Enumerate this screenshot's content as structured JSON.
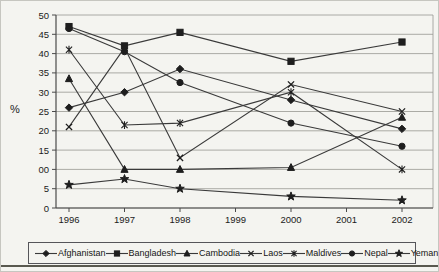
{
  "chart_data": {
    "type": "line",
    "title": "",
    "ylabel": "%",
    "x_categories": [
      "1996",
      "1997",
      "1998",
      "1999",
      "2000",
      "2001",
      "2002"
    ],
    "data_x": [
      "1996",
      "1997",
      "1998",
      "2000",
      "2002"
    ],
    "y_tick_labels": [
      "50",
      "45",
      "40",
      "35",
      "30",
      "25",
      "20",
      "15",
      "00",
      "5",
      "0"
    ],
    "y_tick_values": [
      50,
      45,
      40,
      35,
      30,
      25,
      20,
      15,
      10,
      5,
      0
    ],
    "ylim": [
      0,
      50
    ],
    "grid": true,
    "legend_position": "bottom",
    "series": [
      {
        "name": "Afghanistan",
        "marker": "diamond",
        "values": [
          26,
          30,
          36,
          28,
          20.5
        ]
      },
      {
        "name": "Bangladesh",
        "marker": "square",
        "values": [
          47,
          42,
          45.5,
          38,
          43
        ]
      },
      {
        "name": "Cambodia",
        "marker": "triangle",
        "values": [
          33.5,
          10,
          10,
          10.5,
          23.5
        ]
      },
      {
        "name": "Laos",
        "marker": "x",
        "values": [
          21,
          41.5,
          13,
          32,
          25
        ]
      },
      {
        "name": "Maldives",
        "marker": "asterisk",
        "values": [
          41,
          21.5,
          22,
          30,
          10
        ]
      },
      {
        "name": "Nepal",
        "marker": "circle",
        "values": [
          46.5,
          40.5,
          32.5,
          22,
          16
        ]
      },
      {
        "name": "Yeman",
        "marker": "star",
        "values": [
          6,
          7.5,
          5,
          3,
          2
        ]
      }
    ],
    "colors": {
      "line": "#3a3a3a",
      "marker": "#1e1e1e",
      "grid": "#989892",
      "axis": "#4a4a4a",
      "text": "#1b1b1b",
      "background": "#f4f4f0"
    }
  }
}
